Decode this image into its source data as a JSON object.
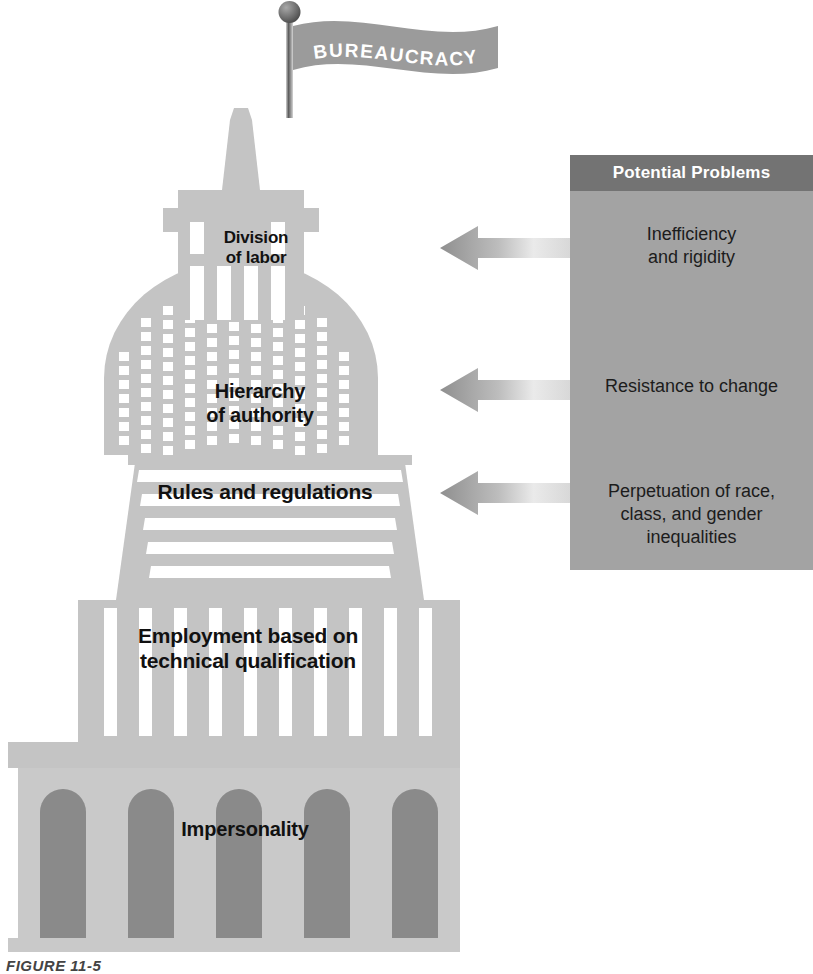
{
  "figure": {
    "flag_label": "BUREAUCRACY",
    "caption": "FIGURE 11-5"
  },
  "building": {
    "levels": [
      {
        "id": "division",
        "label": "Division\nof labor"
      },
      {
        "id": "hierarchy",
        "label": "Hierarchy\nof authority"
      },
      {
        "id": "rules",
        "label": "Rules and regulations"
      },
      {
        "id": "employment",
        "label": "Employment based on\ntechnical qualification"
      },
      {
        "id": "impersonality",
        "label": "Impersonality"
      }
    ]
  },
  "panel": {
    "title": "Potential Problems",
    "problems": [
      {
        "id": "inefficiency",
        "text": "Inefficiency\nand rigidity"
      },
      {
        "id": "resistance",
        "text": "Resistance to change"
      },
      {
        "id": "inequality",
        "text": "Perpetuation of race,\nclass, and gender\ninequalities"
      }
    ]
  },
  "colors": {
    "building_light": "#c9c9c9",
    "building_mid": "#bdbdbd",
    "arch_dark": "#8a8a8a",
    "panel_body": "#a3a3a3",
    "panel_header": "#737373",
    "flag_gray": "#9b9b9b",
    "text_dark": "#111111",
    "white": "#ffffff"
  }
}
